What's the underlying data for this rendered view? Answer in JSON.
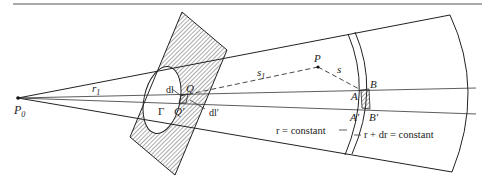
{
  "figure": {
    "type": "diffraction-geometry",
    "labels": {
      "source_point": "P",
      "source_subscript": "0",
      "radius_label": "r",
      "radius_subscript": "1",
      "aperture_contour": "Γ",
      "line_element": "dl",
      "line_element_prime": "dl′",
      "point_Q": "Q",
      "point_Q_prime": "Q′",
      "observation_point": "P",
      "distance_s1": "s",
      "distance_s1_subscript": "1",
      "distance_s": "s",
      "point_A": "A",
      "point_B": "B",
      "point_A_prime": "A′",
      "point_B_prime": "B′",
      "surface_r": "r = constant",
      "surface_r_dr": "r + dr = constant"
    },
    "colors": {
      "line": "#222222",
      "background": "#ffffff",
      "hatch": "#444444"
    }
  }
}
